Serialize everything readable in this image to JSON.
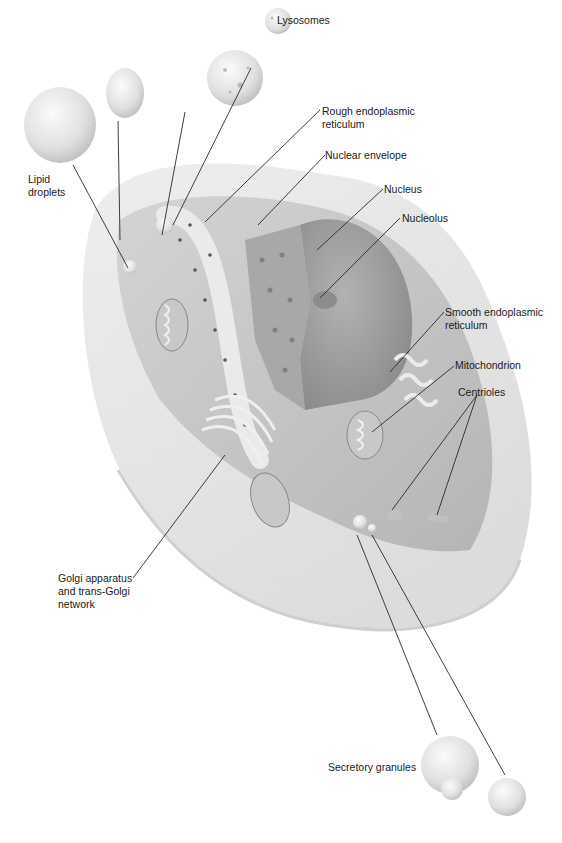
{
  "figure": {
    "labels": {
      "lysosomes": "Lysosomes",
      "rough_er_1": "Rough endoplasmic",
      "rough_er_2": "reticulum",
      "nuclear_envelope": "Nuclear envelope",
      "nucleus": "Nucleus",
      "nucleolus": "Nucleolus",
      "lipid_1": "Lipid",
      "lipid_2": "droplets",
      "smooth_er_1": "Smooth endoplasmic",
      "smooth_er_2": "reticulum",
      "mitochondrion": "Mitochondrion",
      "centrioles": "Centrioles",
      "golgi_1": "Golgi apparatus",
      "golgi_2": "and trans-Golgi",
      "golgi_3": "network",
      "secretory": "Secretory granules"
    },
    "colors": {
      "background": "#ffffff",
      "text": "#1a1a1a",
      "leader_line": "#2a2a2a",
      "cell_light": "#e8e8e8",
      "cell_mid": "#bdbdbd",
      "nucleus": "#9a9a9a"
    }
  }
}
